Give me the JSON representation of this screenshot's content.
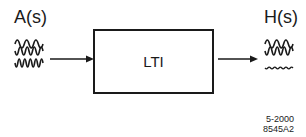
{
  "diagram": {
    "input_label": "A(s)",
    "output_label": "H(s)",
    "block_label": "LTI",
    "input_waves": [
      "low-frequency",
      "medium-frequency",
      "high-frequency"
    ],
    "output_waves": [
      "low-frequency (passed)",
      "medium-frequency (passed)",
      "high-frequency (attenuated)"
    ],
    "figure_code_line1": "5-2000",
    "figure_code_line2": "8545A2"
  }
}
